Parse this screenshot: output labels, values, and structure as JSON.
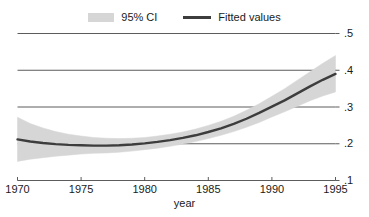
{
  "chart_data": {
    "type": "line",
    "title": "",
    "subtitle": "",
    "xlabel": "year",
    "ylabel": "",
    "xlim": [
      1970,
      1995
    ],
    "ylim": [
      0.1,
      0.5
    ],
    "xticks": [
      1970,
      1975,
      1980,
      1985,
      1990,
      1995
    ],
    "xtick_labels": [
      "1970",
      "1975",
      "1980",
      "1985",
      "1990",
      "1995"
    ],
    "yticks": [
      0.1,
      0.2,
      0.3,
      0.4,
      0.5
    ],
    "ytick_labels": [
      ".1",
      ".2",
      ".3",
      ".4",
      ".5"
    ],
    "grid": true,
    "grid_axis": "y",
    "legend_position": "top-center",
    "legend": [
      {
        "name": "95% CI",
        "marker": "band",
        "color": "#d6d6d6"
      },
      {
        "name": "Fitted values",
        "marker": "line",
        "color": "#3d3d3d"
      }
    ],
    "x": [
      1970,
      1971,
      1972,
      1973,
      1974,
      1975,
      1976,
      1977,
      1978,
      1979,
      1980,
      1981,
      1982,
      1983,
      1984,
      1985,
      1986,
      1987,
      1988,
      1989,
      1990,
      1991,
      1992,
      1993,
      1994,
      1995
    ],
    "series": [
      {
        "name": "Fitted values",
        "color": "#3d3d3d",
        "values": [
          0.212,
          0.206,
          0.202,
          0.199,
          0.197,
          0.196,
          0.195,
          0.195,
          0.196,
          0.198,
          0.201,
          0.205,
          0.21,
          0.216,
          0.223,
          0.232,
          0.242,
          0.254,
          0.268,
          0.284,
          0.301,
          0.318,
          0.337,
          0.356,
          0.374,
          0.39
        ]
      },
      {
        "name": "95% CI upper",
        "color": "#d6d6d6",
        "values": [
          0.272,
          0.255,
          0.243,
          0.233,
          0.226,
          0.221,
          0.217,
          0.215,
          0.214,
          0.215,
          0.217,
          0.221,
          0.226,
          0.232,
          0.24,
          0.25,
          0.261,
          0.275,
          0.291,
          0.309,
          0.329,
          0.35,
          0.373,
          0.396,
          0.419,
          0.44
        ]
      },
      {
        "name": "95% CI lower",
        "color": "#d6d6d6",
        "values": [
          0.152,
          0.158,
          0.162,
          0.166,
          0.169,
          0.172,
          0.174,
          0.175,
          0.177,
          0.18,
          0.184,
          0.188,
          0.193,
          0.199,
          0.206,
          0.214,
          0.223,
          0.233,
          0.245,
          0.258,
          0.273,
          0.287,
          0.302,
          0.317,
          0.33,
          0.341
        ]
      }
    ],
    "annotations": []
  },
  "legend": {
    "ci_label": "95% CI",
    "fitted_label": "Fitted values"
  },
  "axis": {
    "x_title": "year"
  },
  "colors": {
    "band": "#d6d6d6",
    "line": "#3d3d3d",
    "grid": "#4a4a4a",
    "axis": "#4a4a4a",
    "text": "#1a1a1a",
    "background": "#ffffff"
  }
}
